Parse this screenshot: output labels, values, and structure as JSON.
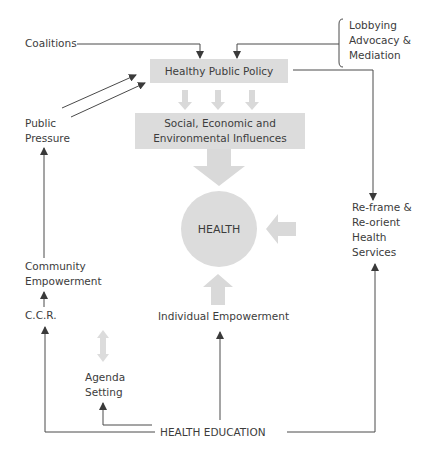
{
  "diagram": {
    "nodes": {
      "coalitions": "Coalitions",
      "lobbying": [
        "Lobbying",
        "Advocacy &",
        "Mediation"
      ],
      "healthy_public_policy": "Healthy Public Policy",
      "influences": [
        "Social, Economic and",
        "Environmental Influences"
      ],
      "health": "HEALTH",
      "public_pressure": [
        "Public",
        "Pressure"
      ],
      "community_empowerment": [
        "Community",
        "Empowerment"
      ],
      "ccr": "C.C.R.",
      "agenda_setting": [
        "Agenda",
        "Setting"
      ],
      "individual_empowerment": "Individual Empowerment",
      "reorient": [
        "Re-frame &",
        "Re-orient",
        "Health",
        "Services"
      ],
      "health_education": "HEALTH EDUCATION"
    },
    "edges": [
      {
        "from": "Coalitions",
        "to": "Healthy Public Policy"
      },
      {
        "from": "Lobbying Advocacy & Mediation",
        "to": "Healthy Public Policy"
      },
      {
        "from": "Public Pressure",
        "to": "Healthy Public Policy",
        "count": 2
      },
      {
        "from": "Healthy Public Policy",
        "to": "Social, Economic and Environmental Influences",
        "style": "grey-block",
        "count": 3
      },
      {
        "from": "Social, Economic and Environmental Influences",
        "to": "HEALTH",
        "style": "grey-block"
      },
      {
        "from": "Healthy Public Policy",
        "to": "Re-frame & Re-orient Health Services"
      },
      {
        "from": "Re-frame & Re-orient Health Services",
        "to": "HEALTH",
        "style": "grey-block"
      },
      {
        "from": "Individual Empowerment",
        "to": "HEALTH",
        "style": "grey-block"
      },
      {
        "from": "Community Empowerment",
        "to": "Public Pressure"
      },
      {
        "from": "C.C.R.",
        "to": "Community Empowerment"
      },
      {
        "from": "Agenda Setting",
        "to": "C.C.R. / Individual Empowerment",
        "style": "grey-bidirectional"
      },
      {
        "from": "HEALTH EDUCATION",
        "to": "C.C.R."
      },
      {
        "from": "HEALTH EDUCATION",
        "to": "Agenda Setting"
      },
      {
        "from": "HEALTH EDUCATION",
        "to": "Individual Empowerment"
      },
      {
        "from": "HEALTH EDUCATION",
        "to": "Re-frame & Re-orient Health Services"
      }
    ],
    "colors": {
      "line": "#4a4a4a",
      "block_fill": "#dcdcdc",
      "block_arrow": "#d9d9d9",
      "text": "#3c3c3c"
    }
  }
}
